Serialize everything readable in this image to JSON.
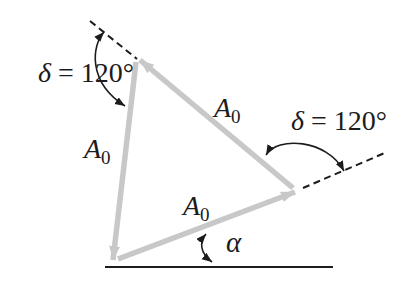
{
  "figure": {
    "colors": {
      "vector_gray": "#c8c8c8",
      "ink": "#1c1c1c",
      "background": "#ffffff"
    },
    "vector_labels": {
      "left": {
        "base": "A",
        "sub": "0"
      },
      "diagonal": {
        "base": "A",
        "sub": "0"
      },
      "bottom": {
        "base": "A",
        "sub": "0"
      }
    },
    "angle_labels": {
      "top": {
        "symbol": "δ",
        "rest": "= 120°"
      },
      "right": {
        "symbol": "δ",
        "rest": "= 120°"
      },
      "alpha": {
        "symbol": "α"
      }
    }
  }
}
